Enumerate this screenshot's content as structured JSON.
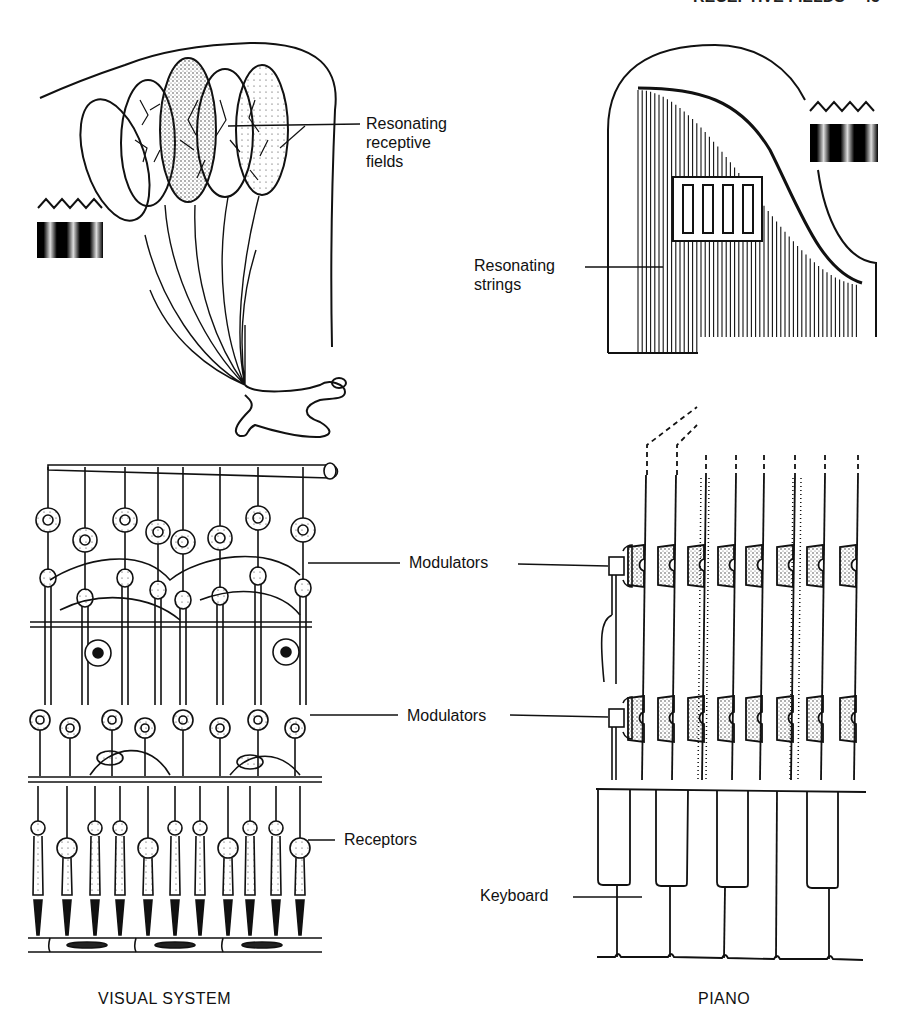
{
  "header": {
    "running_title": "RECEPTIVE FIELDS",
    "page_number": "45"
  },
  "left_figure": {
    "caption": "VISUAL SYSTEM",
    "labels": {
      "receptive_fields": [
        "Resonating",
        "receptive",
        "fields"
      ],
      "modulators_upper": "Modulators",
      "modulators_lower": "Modulators",
      "receptors": "Receptors"
    }
  },
  "right_figure": {
    "caption": "PIANO",
    "labels": {
      "strings": [
        "Resonating",
        "strings"
      ],
      "keyboard": "Keyboard"
    }
  },
  "colors": {
    "ink": "#111111",
    "paper": "#ffffff"
  }
}
